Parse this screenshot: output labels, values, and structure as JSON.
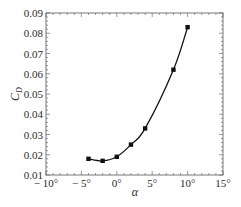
{
  "chart_data": {
    "type": "line",
    "title": "",
    "xlabel": "α",
    "ylabel": "C_D",
    "ylabel_main": "C",
    "ylabel_sub": "D",
    "xlim": [
      -10,
      15
    ],
    "ylim": [
      0.01,
      0.09
    ],
    "grid": false,
    "legend": null,
    "x_ticks": [
      -10,
      -5,
      0,
      5,
      10,
      15
    ],
    "x_tick_labels": [
      "− 10°",
      "− 5°",
      "0°",
      "5°",
      "10°",
      "15°"
    ],
    "y_ticks": [
      0.01,
      0.02,
      0.03,
      0.04,
      0.05,
      0.06,
      0.07,
      0.08,
      0.09
    ],
    "y_tick_labels": [
      "0.01",
      "0.02",
      "0.03",
      "0.04",
      "0.05",
      "0.06",
      "0.07",
      "0.08",
      "0.09"
    ],
    "series": [
      {
        "name": "C_D",
        "marker": "square",
        "color": "#111111",
        "x": [
          -4,
          -2,
          0,
          2,
          4,
          8,
          10
        ],
        "values": [
          0.018,
          0.017,
          0.019,
          0.025,
          0.033,
          0.062,
          0.083
        ]
      }
    ]
  },
  "colors": {
    "line": "#111111",
    "axis": "#555555",
    "text": "#2a2a2a",
    "background": "#ffffff"
  }
}
